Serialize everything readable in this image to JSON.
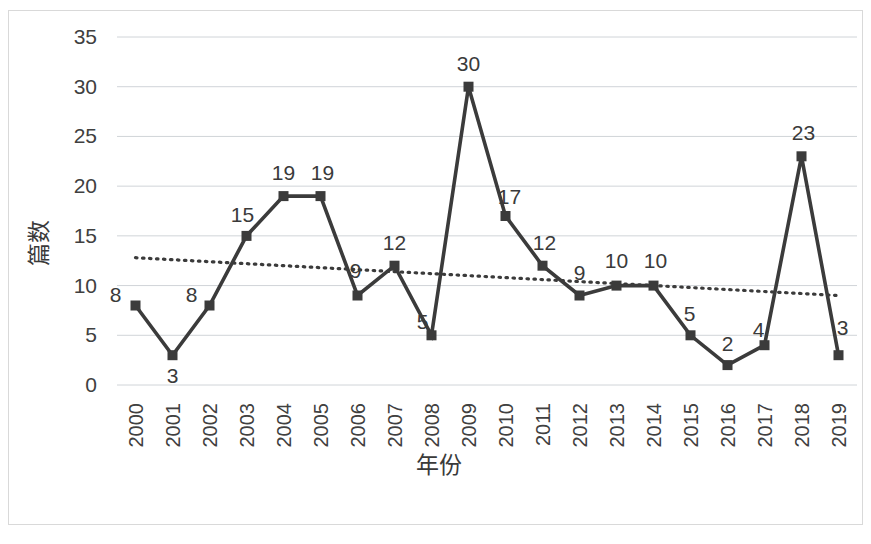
{
  "chart_data": {
    "type": "line",
    "title": "",
    "xlabel": "年份",
    "ylabel": "篇数",
    "categories": [
      "2000",
      "2001",
      "2002",
      "2003",
      "2004",
      "2005",
      "2006",
      "2007",
      "2008",
      "2009",
      "2010",
      "2011",
      "2012",
      "2013",
      "2014",
      "2015",
      "2016",
      "2017",
      "2018",
      "2019"
    ],
    "values": [
      8,
      3,
      8,
      15,
      19,
      19,
      9,
      12,
      5,
      30,
      17,
      12,
      9,
      10,
      10,
      5,
      2,
      4,
      23,
      3
    ],
    "data_labels": [
      "8",
      "3",
      "8",
      "15",
      "19",
      "19",
      "9",
      "12",
      "5",
      "30",
      "17",
      "12",
      "9",
      "10",
      "10",
      "5",
      "2",
      "4",
      "23",
      "3"
    ],
    "ylim": [
      0,
      35
    ],
    "ytick_step": 5,
    "yticks": [
      "0",
      "5",
      "10",
      "15",
      "20",
      "25",
      "30",
      "35"
    ],
    "grid": true,
    "legend": false,
    "series": [
      {
        "name": "篇数",
        "style": "solid-line-square-markers",
        "color": "#3b3b3b",
        "values": [
          8,
          3,
          8,
          15,
          19,
          19,
          9,
          12,
          5,
          30,
          17,
          12,
          9,
          10,
          10,
          5,
          2,
          4,
          23,
          3
        ]
      },
      {
        "name": "趋势线",
        "style": "dotted-trendline",
        "color": "#3b3b3b",
        "start_value": 12.8,
        "end_value": 9.0
      }
    ],
    "annotations": []
  },
  "axes": {
    "x_title": "年份",
    "y_title": "篇数",
    "x_labels_rotation": "vertical"
  }
}
